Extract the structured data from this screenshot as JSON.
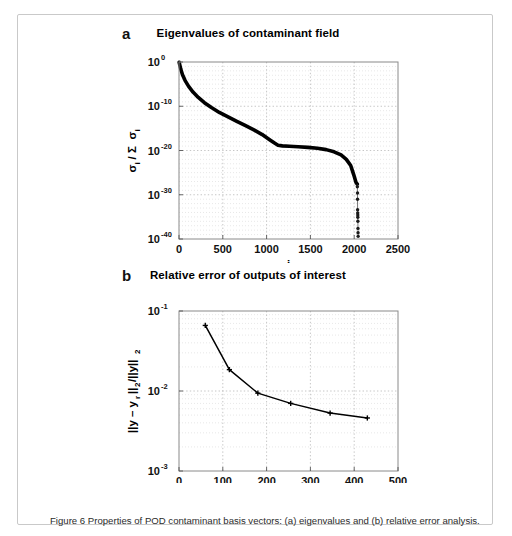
{
  "figure": {
    "caption": "Figure 6 Properties of POD contaminant basis vectors: (a) eigenvalues and (b) relative error analysis."
  },
  "panels": [
    {
      "letter": "a",
      "title": "Eigenvalues of contaminant field"
    },
    {
      "letter": "b",
      "title": "Relative error of outputs of interest"
    }
  ],
  "chart_data": [
    {
      "type": "line",
      "panel": "a",
      "title": "Eigenvalues of contaminant field",
      "xlabel": "i",
      "ylabel": "σ_i / Σ σ_i",
      "ylabel_parts": [
        "σ",
        "i",
        " / Σ ",
        "σ",
        "i"
      ],
      "xlim": [
        0,
        2500
      ],
      "ylim_log10": [
        -40,
        0
      ],
      "yscale": "log",
      "grid": true,
      "legend": "none",
      "xticks": [
        0,
        500,
        1000,
        1500,
        2000,
        2500
      ],
      "xtick_labels": [
        "0",
        "500",
        "1000",
        "1500",
        "2000",
        "2500"
      ],
      "yticks_exponent": [
        0,
        -10,
        -20,
        -30,
        -40
      ],
      "ytick_labels": [
        "10^0",
        "10^-10",
        "10^-20",
        "10^-30",
        "10^-40"
      ],
      "series": [
        {
          "name": "normalized eigenvalue spectrum",
          "x": [
            2,
            8,
            20,
            40,
            70,
            110,
            160,
            220,
            290,
            370,
            460,
            560,
            660,
            760,
            860,
            950,
            1030,
            1090,
            1130,
            1180,
            1260,
            1360,
            1470,
            1580,
            1680,
            1770,
            1850,
            1910,
            1960,
            1995,
            2020,
            2035
          ],
          "y_log10": [
            -0.08,
            -0.6,
            -1.6,
            -2.9,
            -4.2,
            -5.5,
            -6.8,
            -8.0,
            -9.2,
            -10.3,
            -11.4,
            -12.4,
            -13.4,
            -14.4,
            -15.4,
            -16.4,
            -17.5,
            -18.3,
            -18.8,
            -18.95,
            -19.05,
            -19.15,
            -19.3,
            -19.5,
            -19.8,
            -20.3,
            -21.0,
            -22.0,
            -23.4,
            -25.5,
            -27.2,
            -27.6
          ]
        }
      ],
      "tail_scatter": {
        "name": "numerical-noise eigenvalues",
        "x": [
          2036,
          2038,
          2038,
          2039,
          2040,
          2041,
          2041,
          2042,
          2043,
          2044,
          2045
        ],
        "y_log10": [
          -28.2,
          -29.6,
          -31.0,
          -33.4,
          -34.1,
          -34.6,
          -35.1,
          -36.0,
          -37.6,
          -38.6,
          -39.4
        ]
      }
    },
    {
      "type": "line",
      "panel": "b",
      "title": "Relative error of outputs of interest",
      "xlabel": "Number of samples",
      "ylabel": "||y - y_r||_2 / ||y||_2",
      "xlim": [
        0,
        500
      ],
      "ylim_log10": [
        -3,
        -1
      ],
      "yscale": "log",
      "grid": true,
      "legend": "none",
      "xticks": [
        0,
        100,
        200,
        300,
        400,
        500
      ],
      "xtick_labels": [
        "0",
        "100",
        "200",
        "300",
        "400",
        "500"
      ],
      "yticks_exponent": [
        -1,
        -2,
        -3
      ],
      "ytick_labels": [
        "10^-1",
        "10^-2",
        "10^-3"
      ],
      "series": [
        {
          "name": "relative output error",
          "marker": "plus",
          "x": [
            60,
            115,
            180,
            255,
            345,
            430
          ],
          "y": [
            0.066,
            0.0185,
            0.0094,
            0.007,
            0.0053,
            0.0046
          ]
        }
      ]
    }
  ]
}
